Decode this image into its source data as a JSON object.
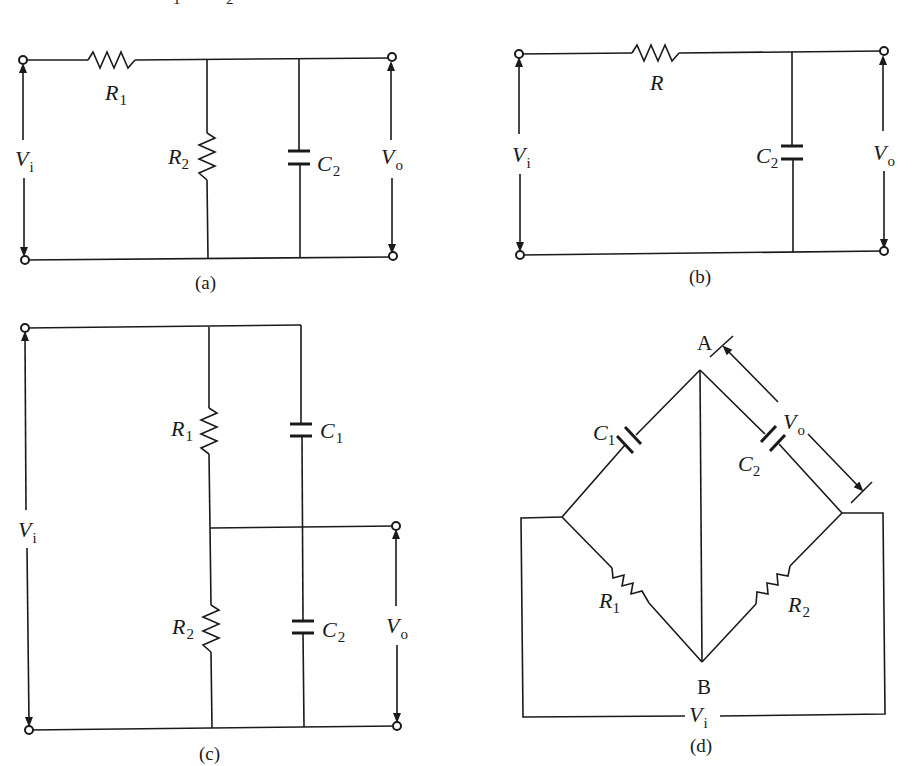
{
  "figure": {
    "top_fragment": "1 2",
    "panels": [
      {
        "id": "a",
        "caption": "(a)",
        "components": [
          {
            "name": "R",
            "sub": "1",
            "type": "resistor",
            "placement": "series"
          },
          {
            "name": "R",
            "sub": "2",
            "type": "resistor",
            "placement": "shunt"
          },
          {
            "name": "C",
            "sub": "2",
            "type": "capacitor",
            "placement": "shunt"
          }
        ],
        "input": {
          "name": "V",
          "sub": "i"
        },
        "output": {
          "name": "V",
          "sub": "o"
        }
      },
      {
        "id": "b",
        "caption": "(b)",
        "components": [
          {
            "name": "R",
            "sub": "",
            "type": "resistor",
            "placement": "series"
          },
          {
            "name": "C",
            "sub": "2",
            "type": "capacitor",
            "placement": "shunt"
          }
        ],
        "input": {
          "name": "V",
          "sub": "i"
        },
        "output": {
          "name": "V",
          "sub": "o"
        }
      },
      {
        "id": "c",
        "caption": "(c)",
        "components": [
          {
            "name": "R",
            "sub": "1",
            "type": "resistor",
            "placement": "upper"
          },
          {
            "name": "C",
            "sub": "1",
            "type": "capacitor",
            "placement": "upper"
          },
          {
            "name": "R",
            "sub": "2",
            "type": "resistor",
            "placement": "lower"
          },
          {
            "name": "C",
            "sub": "2",
            "type": "capacitor",
            "placement": "lower"
          }
        ],
        "input": {
          "name": "V",
          "sub": "i"
        },
        "output": {
          "name": "V",
          "sub": "o"
        }
      },
      {
        "id": "d",
        "caption": "(d)",
        "nodes": [
          "A",
          "B"
        ],
        "components": [
          {
            "name": "C",
            "sub": "1",
            "type": "capacitor",
            "placement": "upper-left"
          },
          {
            "name": "C",
            "sub": "2",
            "type": "capacitor",
            "placement": "upper-right"
          },
          {
            "name": "R",
            "sub": "1",
            "type": "resistor",
            "placement": "lower-left"
          },
          {
            "name": "R",
            "sub": "2",
            "type": "resistor",
            "placement": "lower-right"
          }
        ],
        "input": {
          "name": "V",
          "sub": "i"
        },
        "output": {
          "name": "V",
          "sub": "o"
        }
      }
    ]
  }
}
